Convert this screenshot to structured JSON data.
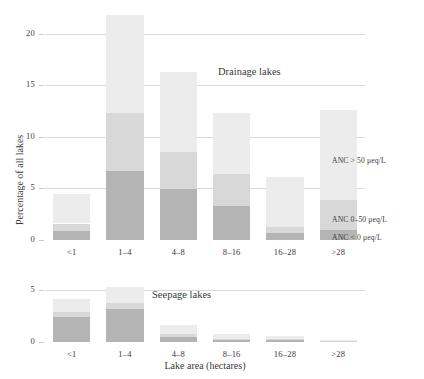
{
  "figure": {
    "axis_x_title": "Lake area (hectares)",
    "axis_y_title": "Percentage of all lakes"
  },
  "legend": {
    "items": [
      {
        "key": "high",
        "label": "ANC > 50 μeq/L",
        "color": "#ececec"
      },
      {
        "key": "mid",
        "label": "ANC 0–50 μeq/L",
        "color": "#d8d8d8"
      },
      {
        "key": "low",
        "label": "ANC < 0 μeq/L",
        "color": "#b4b4b4"
      }
    ]
  },
  "chart_data": [
    {
      "type": "bar",
      "title": "Drainage lakes",
      "stacked": true,
      "xlabel": "Lake area (hectares)",
      "ylabel": "Percentage of all lakes",
      "categories": [
        "<1",
        "1–4",
        "4–8",
        "8–16",
        "16–28",
        ">28"
      ],
      "ylim": [
        0,
        22.5
      ],
      "yticks": [
        0,
        5,
        10,
        15,
        20
      ],
      "ytick_labels": [
        "0",
        "5",
        "10",
        "15",
        "20"
      ],
      "grid": true,
      "legend_position": "right",
      "series": [
        {
          "name": "ANC < 0 μeq/L",
          "color": "#b4b4b4",
          "values": [
            0.9,
            6.7,
            4.9,
            3.3,
            0.7,
            1.0
          ]
        },
        {
          "name": "ANC 0–50 μeq/L",
          "color": "#d8d8d8",
          "values": [
            0.7,
            5.6,
            3.6,
            3.1,
            0.6,
            2.9
          ]
        },
        {
          "name": "ANC > 50 μeq/L",
          "color": "#ececec",
          "values": [
            2.9,
            9.5,
            7.8,
            5.9,
            4.8,
            8.7
          ]
        }
      ],
      "totals": [
        4.5,
        21.8,
        16.3,
        12.3,
        6.1,
        12.6
      ]
    },
    {
      "type": "bar",
      "title": "Seepage lakes",
      "stacked": true,
      "xlabel": "Lake area (hectares)",
      "ylabel": "Percentage of all lakes",
      "categories": [
        "<1",
        "1–4",
        "4–8",
        "8–16",
        "16–28",
        ">28"
      ],
      "ylim": [
        0,
        6.0
      ],
      "yticks": [
        0,
        5
      ],
      "ytick_labels": [
        "0",
        "5"
      ],
      "grid": true,
      "legend_position": "none",
      "series": [
        {
          "name": "ANC < 0 μeq/L",
          "color": "#b4b4b4",
          "values": [
            2.4,
            3.2,
            0.5,
            0.15,
            0.2,
            0.05
          ]
        },
        {
          "name": "ANC 0–50 μeq/L",
          "color": "#d8d8d8",
          "values": [
            0.5,
            0.6,
            0.3,
            0.15,
            0.1,
            0.05
          ]
        },
        {
          "name": "ANC > 50 μeq/L",
          "color": "#ececec",
          "values": [
            1.3,
            1.5,
            0.8,
            0.45,
            0.25,
            0.1
          ]
        }
      ],
      "totals": [
        4.2,
        5.3,
        1.6,
        0.75,
        0.55,
        0.2
      ]
    }
  ]
}
